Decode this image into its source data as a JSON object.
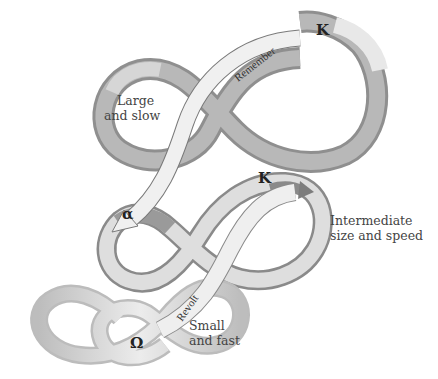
{
  "diagram": {
    "type": "panarchy-adaptive-cycles",
    "cycles": [
      {
        "id": "large",
        "label_line1": "Large",
        "label_line2": "and slow",
        "symbol": "K"
      },
      {
        "id": "intermediate",
        "label_line1": "Intermediate",
        "label_line2": "size and speed",
        "symbol_k": "K",
        "symbol_alpha": "α"
      },
      {
        "id": "small",
        "label_line1": "Small",
        "label_line2": "and fast",
        "symbol": "Ω"
      }
    ],
    "connections": [
      {
        "id": "remember",
        "label": "Remember",
        "from": "large",
        "to": "intermediate"
      },
      {
        "id": "revolt",
        "label": "Revolt",
        "from": "small",
        "to": "intermediate"
      }
    ],
    "colors": {
      "ribbon_light": "#e6e6e6",
      "ribbon_mid": "#bdbdbd",
      "ribbon_dark": "#8f8f8f",
      "arrow_light": "#efefef",
      "arrow_stroke": "#7a7a7a",
      "text": "#444444"
    }
  }
}
